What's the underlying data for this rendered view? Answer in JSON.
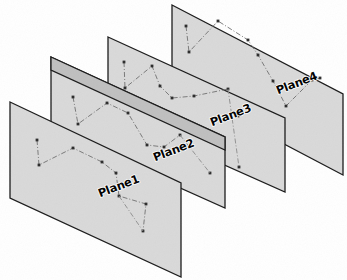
{
  "figure": {
    "background_color": "#ffffff",
    "plane_fill_color": "#d9d9d9",
    "plane_band_color": "#bfbfbf",
    "plane_edge_color": "#1a1a1a",
    "series_line_color": "#6e6e6e",
    "connector_line_color": "#8a8a8a",
    "marker_color": "#2b2b2b",
    "line_style": "dash-dot",
    "projection": "oblique / sheared parallelogram"
  },
  "chart_data": {
    "type": "scatter",
    "xlabel": "",
    "ylabel": "",
    "grid": false,
    "legend_position": "in-plane labels",
    "plane_count": 4,
    "planes": [
      {
        "label": "Plane1",
        "label_x": 140,
        "label_y": 182,
        "label_rotation": -21,
        "z_order": 1,
        "corners": [
          [
            10,
            102
          ],
          [
            181,
            183
          ],
          [
            181,
            277
          ],
          [
            10,
            198
          ]
        ],
        "points": [
          [
            37,
            140
          ],
          [
            39,
            165
          ],
          [
            73,
            148
          ],
          [
            102,
            162
          ],
          [
            116,
            173
          ],
          [
            119,
            196
          ],
          [
            146,
            204
          ],
          [
            143,
            231
          ]
        ],
        "path_order": [
          0,
          1,
          2,
          3,
          4,
          5,
          6,
          7
        ],
        "connector_from": [
          5
        ],
        "connector_to": [
          [
            143,
            231
          ]
        ]
      },
      {
        "label": "Plane2",
        "label_x": 195,
        "label_y": 146,
        "label_rotation": -21,
        "z_order": 2,
        "corners": [
          [
            51,
            57
          ],
          [
            225,
            137
          ],
          [
            225,
            208
          ],
          [
            51,
            130
          ]
        ],
        "points": [
          [
            73,
            97
          ],
          [
            78,
            124
          ],
          [
            107,
            103
          ],
          [
            128,
            113
          ],
          [
            147,
            145
          ],
          [
            164,
            147
          ],
          [
            180,
            135
          ],
          [
            210,
            173
          ]
        ],
        "path_order": [
          0,
          1,
          2,
          3,
          4,
          5,
          6
        ],
        "connector_from": [
          6
        ],
        "connector_to": [
          [
            210,
            173
          ]
        ]
      },
      {
        "label": "Plane3",
        "label_x": 252,
        "label_y": 111,
        "label_rotation": -21,
        "z_order": 3,
        "corners": [
          [
            108,
            37
          ],
          [
            285,
            118
          ],
          [
            285,
            192
          ],
          [
            108,
            113
          ]
        ],
        "points": [
          [
            124,
            62
          ],
          [
            125,
            88
          ],
          [
            152,
            66
          ],
          [
            160,
            86
          ],
          [
            172,
            98
          ],
          [
            194,
            96
          ],
          [
            228,
            89
          ],
          [
            238,
            116
          ],
          [
            239,
            167
          ]
        ],
        "path_order": [
          0,
          1,
          2,
          3,
          4,
          5,
          6
        ],
        "connector_from": [
          6
        ],
        "connector_to": [
          [
            239,
            167
          ]
        ]
      },
      {
        "label": "Plane4",
        "label_x": 318,
        "label_y": 79,
        "label_rotation": -21,
        "z_order": 4,
        "corners": [
          [
            172,
            5
          ],
          [
            343,
            94
          ],
          [
            343,
            175
          ],
          [
            172,
            85
          ]
        ],
        "points": [
          [
            186,
            26
          ],
          [
            189,
            52
          ],
          [
            218,
            21
          ],
          [
            248,
            40
          ],
          [
            258,
            55
          ],
          [
            273,
            81
          ],
          [
            286,
            106
          ],
          [
            312,
            80
          ],
          [
            320,
            78
          ]
        ],
        "path_order": [
          0,
          1,
          2,
          3,
          4,
          5,
          6,
          7,
          8
        ],
        "connector_from": [
          6
        ],
        "connector_to": [
          [
            286,
            106
          ]
        ]
      }
    ]
  },
  "labels": {
    "plane1": "Plane1",
    "plane2": "Plane2",
    "plane3": "Plane3",
    "plane4": "Plane4"
  }
}
